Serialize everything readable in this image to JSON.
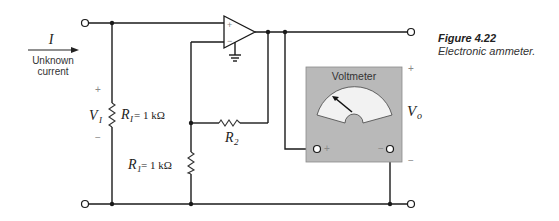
{
  "figure": {
    "number": "Figure 4.22",
    "caption": "Electronic ammeter."
  },
  "input": {
    "current_symbol": "I",
    "current_label_line1": "Unknown",
    "current_label_line2": "current",
    "voltage_symbol": "V",
    "voltage_subscript": "I",
    "plus": "+",
    "minus": "−"
  },
  "components": {
    "ri": {
      "symbol": "R",
      "subscript": "I",
      "value": " = 1 kΩ"
    },
    "r1": {
      "symbol": "R",
      "subscript": "1",
      "value": " = 1 kΩ"
    },
    "r2": {
      "symbol": "R",
      "subscript": "2"
    },
    "opamp": {
      "plus": "+",
      "minus": "−"
    }
  },
  "voltmeter": {
    "title": "Voltmeter",
    "plus_terminal": "+",
    "minus_terminal": "−"
  },
  "output": {
    "voltage_symbol": "V",
    "voltage_subscript": "o",
    "plus": "+",
    "minus": "−"
  },
  "colors": {
    "voltmeter_body": "#b9b9b9",
    "voltmeter_face": "#f2f2f2"
  }
}
